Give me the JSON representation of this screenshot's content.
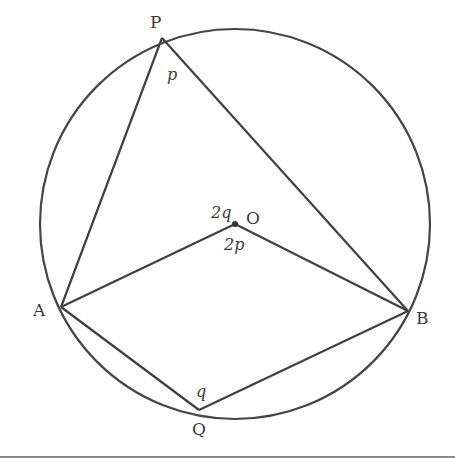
{
  "diagram": {
    "circle": {
      "center": "O",
      "cx": 235,
      "cy": 224,
      "r": 195
    },
    "points": {
      "P": {
        "label": "P",
        "x": 162,
        "y": 38
      },
      "A": {
        "label": "A",
        "x": 61,
        "y": 307
      },
      "B": {
        "label": "B",
        "x": 408,
        "y": 311
      },
      "O": {
        "label": "O",
        "x": 235,
        "y": 224
      },
      "Q": {
        "label": "Q",
        "x": 199,
        "y": 410
      }
    },
    "segments": [
      "PA",
      "PB",
      "AO",
      "OB",
      "AQ",
      "QB"
    ],
    "angle_labels": {
      "p": "p",
      "q": "q",
      "two_q": "2q",
      "two_p": "2p"
    },
    "stroke_color": "#404040",
    "rule_color": "#8a8a8a"
  }
}
